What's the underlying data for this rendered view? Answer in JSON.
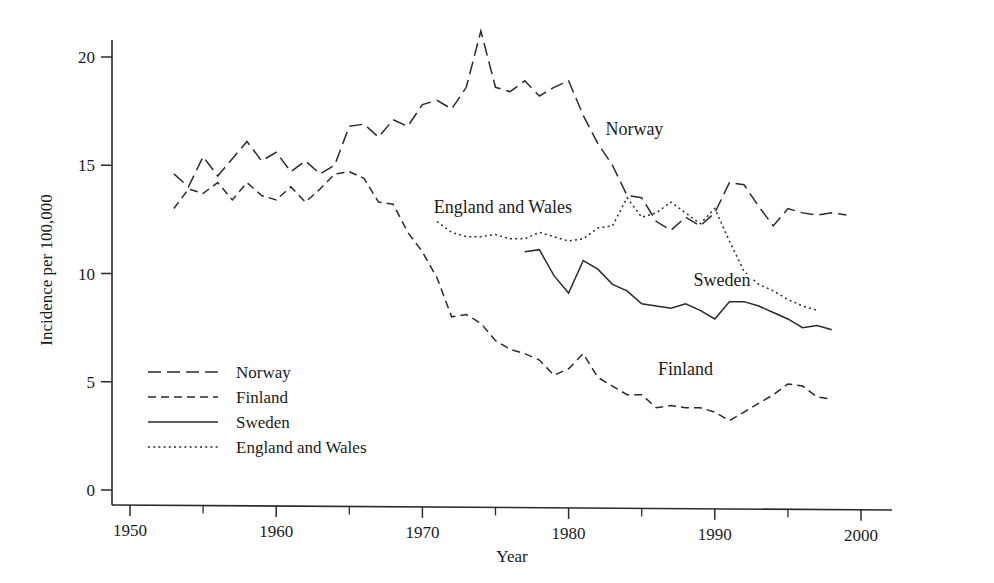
{
  "chart_data": {
    "type": "line",
    "title": "",
    "xlabel": "Year",
    "ylabel": "Incidence per 100,000",
    "xlim": [
      1947,
      2002
    ],
    "ylim": [
      0,
      21.8
    ],
    "xticks": [
      1950,
      1960,
      1970,
      1980,
      1990,
      2000
    ],
    "xticks_minor": [
      1955,
      1965,
      1975,
      1985,
      1995
    ],
    "yticks": [
      0,
      5,
      10,
      15,
      20
    ],
    "grid": false,
    "legend_position": "lower-left-inside",
    "series": [
      {
        "name": "Norway",
        "style": "long-dash",
        "inline_label": "Norway",
        "x": [
          1953,
          1954,
          1955,
          1956,
          1957,
          1958,
          1959,
          1960,
          1961,
          1962,
          1963,
          1964,
          1965,
          1966,
          1967,
          1968,
          1969,
          1970,
          1971,
          1972,
          1973,
          1974,
          1975,
          1976,
          1977,
          1978,
          1979,
          1980,
          1981,
          1982,
          1983,
          1984,
          1985,
          1986,
          1987,
          1988,
          1989,
          1990,
          1991,
          1992,
          1993,
          1994,
          1995,
          1996,
          1997,
          1998,
          1999
        ],
        "values": [
          14.6,
          14.0,
          15.4,
          14.5,
          15.3,
          16.1,
          15.2,
          15.6,
          14.7,
          15.2,
          14.6,
          15.0,
          16.8,
          16.9,
          16.3,
          17.1,
          16.8,
          17.8,
          18.0,
          17.6,
          18.6,
          21.2,
          18.6,
          18.4,
          18.9,
          18.2,
          18.6,
          18.9,
          17.3,
          16.0,
          15.0,
          13.6,
          13.5,
          12.4,
          12.0,
          12.6,
          12.2,
          12.8,
          14.2,
          14.1,
          13.1,
          12.2,
          13.0,
          12.8,
          12.7,
          12.8,
          12.7
        ]
      },
      {
        "name": "Finland",
        "style": "medium-dash",
        "inline_label": "Finland",
        "x": [
          1953,
          1954,
          1955,
          1956,
          1957,
          1958,
          1959,
          1960,
          1961,
          1962,
          1963,
          1964,
          1965,
          1966,
          1967,
          1968,
          1969,
          1970,
          1971,
          1972,
          1973,
          1974,
          1975,
          1976,
          1977,
          1978,
          1979,
          1980,
          1981,
          1982,
          1983,
          1984,
          1985,
          1986,
          1987,
          1988,
          1989,
          1990,
          1991,
          1992,
          1993,
          1994,
          1995,
          1996,
          1997,
          1998
        ],
        "values": [
          13.0,
          13.9,
          13.7,
          14.2,
          13.4,
          14.2,
          13.6,
          13.4,
          14.0,
          13.3,
          13.9,
          14.6,
          14.7,
          14.4,
          13.3,
          13.2,
          11.9,
          11.0,
          9.8,
          8.0,
          8.1,
          7.7,
          6.9,
          6.5,
          6.3,
          6.0,
          5.3,
          5.6,
          6.3,
          5.2,
          4.8,
          4.4,
          4.4,
          3.8,
          3.9,
          3.8,
          3.8,
          3.6,
          3.2,
          3.6,
          4.0,
          4.4,
          4.9,
          4.8,
          4.3,
          4.2
        ]
      },
      {
        "name": "Sweden",
        "style": "solid",
        "inline_label": "Sweden",
        "x": [
          1977,
          1978,
          1979,
          1980,
          1981,
          1982,
          1983,
          1984,
          1985,
          1986,
          1987,
          1988,
          1989,
          1990,
          1991,
          1992,
          1993,
          1994,
          1995,
          1996,
          1997,
          1998
        ],
        "values": [
          11.0,
          11.1,
          9.9,
          9.1,
          10.6,
          10.2,
          9.5,
          9.2,
          8.6,
          8.5,
          8.4,
          8.6,
          8.3,
          7.9,
          8.7,
          8.7,
          8.5,
          8.2,
          7.9,
          7.5,
          7.6,
          7.4
        ]
      },
      {
        "name": "England and Wales",
        "style": "dotted",
        "inline_label": "England and Wales",
        "x": [
          1971,
          1972,
          1973,
          1974,
          1975,
          1976,
          1977,
          1978,
          1979,
          1980,
          1981,
          1982,
          1983,
          1984,
          1985,
          1986,
          1987,
          1988,
          1989,
          1990,
          1991,
          1992,
          1993,
          1994,
          1995,
          1996,
          1997
        ],
        "values": [
          12.4,
          11.9,
          11.7,
          11.7,
          11.8,
          11.6,
          11.6,
          11.9,
          11.7,
          11.5,
          11.6,
          12.1,
          12.2,
          13.5,
          12.6,
          12.8,
          13.3,
          12.8,
          12.3,
          13.0,
          11.5,
          10.1,
          9.5,
          9.2,
          8.8,
          8.5,
          8.3
        ]
      }
    ]
  },
  "axes": {
    "y_title": "Incidence per 100,000",
    "x_title": "Year",
    "y_tick_labels": [
      "0",
      "5",
      "10",
      "15",
      "20"
    ],
    "x_tick_labels": [
      "1950",
      "1960",
      "1970",
      "1980",
      "1990",
      "2000"
    ]
  },
  "legend": {
    "items": [
      {
        "label": "Norway",
        "style": "long-dash"
      },
      {
        "label": "Finland",
        "style": "medium-dash"
      },
      {
        "label": "Sweden",
        "style": "solid"
      },
      {
        "label": "England and Wales",
        "style": "dotted"
      }
    ]
  },
  "inline_labels": [
    {
      "text": "Norway",
      "x": 1984.5,
      "y": 16.4
    },
    {
      "text": "England and Wales",
      "x": 1975.5,
      "y": 12.8
    },
    {
      "text": "Sweden",
      "x": 1990.5,
      "y": 9.4
    },
    {
      "text": "Finland",
      "x": 1988.0,
      "y": 5.3
    }
  ],
  "colors": {
    "ink": "#1a1a1a",
    "line": "#2b2b2b",
    "background": "#ffffff"
  }
}
